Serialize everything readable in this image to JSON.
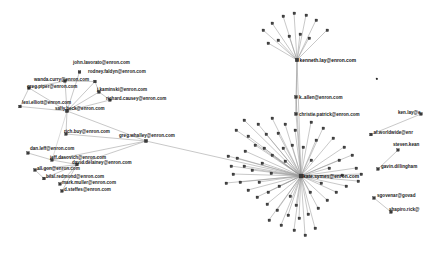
{
  "graph": {
    "type": "network-graph",
    "title": "Enron email network",
    "node_count": 118,
    "palette": {
      "background": "#ffffff",
      "node_fill": "#3a3a3a",
      "node_stroke": "#1e1e1e",
      "edge": "#9a9a9a",
      "label": "#1a1a1a"
    },
    "labeled_nodes": [
      {
        "id": "john.lavorato",
        "label": "john.lavorato@enron.com",
        "x": 79.5,
        "y": 72.0,
        "lx": 73.0,
        "ly": 63.5,
        "r": 1.6,
        "cluster": "left"
      },
      {
        "id": "rodney.faldyn",
        "label": "rodney.faldyn@enron.com",
        "x": 95.0,
        "y": 81.5,
        "lx": 88.0,
        "ly": 73.0,
        "r": 1.6,
        "cluster": "left"
      },
      {
        "id": "wanda.curry",
        "label": "wanda.curry@enron.com",
        "x": 65.0,
        "y": 81.0,
        "lx": 34.0,
        "ly": 81.0,
        "r": 1.6,
        "cluster": "left"
      },
      {
        "id": "greg.piper",
        "label": "greg.piper@enron.com",
        "x": 29.0,
        "y": 88.0,
        "lx": 27.0,
        "ly": 88.0,
        "r": 1.6,
        "cluster": "left"
      },
      {
        "id": "j.kaminski",
        "label": "j.kaminski@enron.com",
        "x": 99.0,
        "y": 92.0,
        "lx": 97.0,
        "ly": 91.0,
        "r": 1.6,
        "cluster": "left"
      },
      {
        "id": "richard.causey",
        "label": "richard.causey@enron.com",
        "x": 110.0,
        "y": 100.0,
        "lx": 106.0,
        "ly": 99.5,
        "r": 1.6,
        "cluster": "left"
      },
      {
        "id": "lexi.elliott",
        "label": "lexi.elliott@enron.com",
        "x": 20.0,
        "y": 106.5,
        "lx": 22.0,
        "ly": 104.0,
        "r": 1.6,
        "cluster": "left"
      },
      {
        "id": "sally.beck",
        "label": "sally.beck@enron.com",
        "x": 67.0,
        "y": 111.0,
        "lx": 55.0,
        "ly": 110.0,
        "r": 1.9,
        "cluster": "left"
      },
      {
        "id": "rich.buy",
        "label": "rich.buy@enron.com",
        "x": 66.0,
        "y": 134.0,
        "lx": 64.0,
        "ly": 133.0,
        "r": 1.6,
        "cluster": "left"
      },
      {
        "id": "greg.whalley",
        "label": "greg.whalley@enron.com",
        "x": 146.0,
        "y": 141.0,
        "lx": 119.0,
        "ly": 137.0,
        "r": 1.9,
        "cluster": "left"
      },
      {
        "id": "dan.leff",
        "label": "dan.leff@enron.com",
        "x": 28.0,
        "y": 153.0,
        "lx": 30.0,
        "ly": 149.5,
        "r": 1.6,
        "cluster": "left"
      },
      {
        "id": "jeff.dasovich",
        "label": "jeff.dasovich@enron.com",
        "x": 52.0,
        "y": 160.0,
        "lx": 50.0,
        "ly": 158.5,
        "r": 1.6,
        "cluster": "left"
      },
      {
        "id": "david.delainey",
        "label": "david.delainey@enron.com",
        "x": 77.0,
        "y": 164.5,
        "lx": 72.0,
        "ly": 164.0,
        "r": 1.6,
        "cluster": "left"
      },
      {
        "id": "all.gon",
        "label": "all.gon@enron.com",
        "x": 35.0,
        "y": 170.0,
        "lx": 37.0,
        "ly": 170.0,
        "r": 1.6,
        "cluster": "left"
      },
      {
        "id": "bilal.redmond",
        "label": "bilal.redmond@enron.com",
        "x": 44.0,
        "y": 178.5,
        "lx": 46.0,
        "ly": 178.0,
        "r": 1.6,
        "cluster": "left"
      },
      {
        "id": "mark.muller",
        "label": "mark.muller@enron.com",
        "x": 60.0,
        "y": 184.0,
        "lx": 62.0,
        "ly": 184.0,
        "r": 1.6,
        "cluster": "left"
      },
      {
        "id": "d.steffes",
        "label": "d.steffes@enron.com",
        "x": 62.0,
        "y": 191.0,
        "lx": 64.0,
        "ly": 191.0,
        "r": 1.6,
        "cluster": "left"
      },
      {
        "id": "kenneth.lay",
        "label": "kenneth.lay@enron.com",
        "x": 297.0,
        "y": 60.0,
        "lx": 299.5,
        "ly": 61.5,
        "r": 2.1,
        "cluster": "right"
      },
      {
        "id": "k.allen",
        "label": "k..allen@enron.com",
        "x": 296.0,
        "y": 97.0,
        "lx": 299.0,
        "ly": 98.5,
        "r": 1.7,
        "cluster": "right"
      },
      {
        "id": "christie.patrick",
        "label": "christie.patrick@enron.com",
        "x": 296.0,
        "y": 114.0,
        "lx": 299.0,
        "ly": 115.5,
        "r": 1.7,
        "cluster": "right"
      },
      {
        "id": "central.hub",
        "label": "kate.symes@enron.com",
        "x": 301.0,
        "y": 176.0,
        "lx": 303.0,
        "ly": 177.5,
        "r": 2.3,
        "cluster": "right"
      },
      {
        "id": "ken.lay.alt",
        "label": "ken.lay@e",
        "x": 421.0,
        "y": 114.0,
        "lx": 398.0,
        "ly": 113.5,
        "r": 1.6,
        "cluster": "island"
      },
      {
        "id": "af.worldwide",
        "label": "af.worldwide@enr",
        "x": 371.0,
        "y": 134.5,
        "lx": 373.5,
        "ly": 133.5,
        "r": 1.6,
        "cluster": "island"
      },
      {
        "id": "steven.kean",
        "label": "steven.kean",
        "x": 398.0,
        "y": 150.0,
        "lx": 393.0,
        "ly": 146.0,
        "r": 1.5,
        "cluster": "island"
      },
      {
        "id": "gavin.dillingham",
        "label": "gavin.dillingham",
        "x": 378.0,
        "y": 169.0,
        "lx": 381.0,
        "ly": 168.0,
        "r": 1.6,
        "cluster": "island"
      },
      {
        "id": "sgovenar",
        "label": "sgovenar@govad",
        "x": 374.0,
        "y": 198.0,
        "lx": 377.0,
        "ly": 197.0,
        "r": 1.6,
        "cluster": "island"
      },
      {
        "id": "shapiro.rick",
        "label": "shapiro.rick@",
        "x": 391.0,
        "y": 212.0,
        "lx": 389.0,
        "ly": 211.0,
        "r": 1.6,
        "cluster": "island"
      }
    ]
  }
}
